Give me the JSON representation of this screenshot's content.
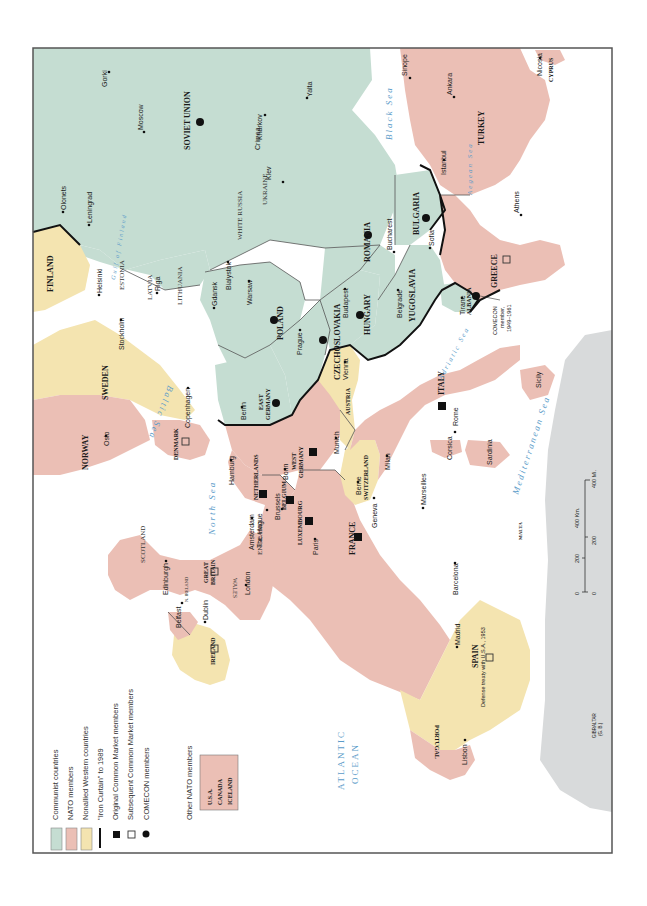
{
  "colors": {
    "communist": "#c5ddd2",
    "nato": "#ebbfb5",
    "nonallied": "#f4e4b0",
    "other_land": "#d8dadb",
    "sea_label": "#5a9bc9",
    "frame": "#555555"
  },
  "legend": {
    "items": [
      {
        "symbol": "swatch-communist",
        "label": "Communist countries"
      },
      {
        "symbol": "swatch-nato",
        "label": "NATO members"
      },
      {
        "symbol": "swatch-nonallied",
        "label": "Nonallied Western countries"
      },
      {
        "symbol": "iron-curtain-line",
        "label": "\"Iron Curtain\" to 1989"
      },
      {
        "symbol": "filled-square",
        "label": "Original Common Market members"
      },
      {
        "symbol": "open-square",
        "label": "Subsequent Common Market members"
      },
      {
        "symbol": "filled-circle",
        "label": "COMECON members"
      }
    ],
    "other_nato_title": "Other NATO members",
    "other_nato": [
      "U.S.A.",
      "CANADA",
      "ICELAND"
    ]
  },
  "countries": {
    "soviet_union": "SOVIET UNION",
    "finland": "FINLAND",
    "sweden": "SWEDEN",
    "norway": "NORWAY",
    "denmark": "DENMARK",
    "poland": "POLAND",
    "east_germany": "EAST GERMANY",
    "west_germany": "WEST GERMANY",
    "czechoslovakia": "CZECHOSLOVAKIA",
    "hungary": "HUNGARY",
    "romania": "ROMANIA",
    "bulgaria": "BULGARIA",
    "yugoslavia": "YUGOSLAVIA",
    "albania": "ALBANIA",
    "greece": "GREECE",
    "turkey": "TURKEY",
    "cyprus": "CYPRUS",
    "austria": "AUSTRIA",
    "switzerland": "SWITZERLAND",
    "italy": "ITALY",
    "france": "FRANCE",
    "netherlands": "NETHERLANDS",
    "belgium": "BELGIUM",
    "luxembourg": "LUXEMBOURG",
    "great_britain": "GREAT BRITAIN",
    "ireland": "IRELAND",
    "spain": "SPAIN",
    "portugal": "PORTUGAL",
    "malta": "MALTA",
    "gibraltar": "GIBRALTAR",
    "gibraltar_note": "(G. B.)"
  },
  "regions": {
    "ukraine": "UKRAINE",
    "white_russia": "WHITE RUSSIA",
    "lithuania": "LITHUANIA",
    "latvia": "LATVIA",
    "estonia": "ESTONIA",
    "scotland": "SCOTLAND",
    "england": "ENGLAND",
    "wales": "WALES",
    "n_ireland": "N. IRELAND",
    "crimea": "Crimea",
    "corsica": "Corsica",
    "sardinia": "Sardinia",
    "sicily": "Sicily"
  },
  "cities": {
    "gorki": "Gorki",
    "moscow": "Moscow",
    "olonets": "Olonets",
    "leningrad": "Leningrad",
    "kharkov": "Kharkov",
    "kiev": "Kiev",
    "yalta": "Yalta",
    "sinope": "Sinope",
    "ankara": "Ankara",
    "nicosia": "Nicosia",
    "istanbul": "Istanbul",
    "athens": "Athens",
    "sofia": "Sofia",
    "bucharest": "Bucharest",
    "belgrade": "Belgrade",
    "tirane": "Tirane",
    "budapest": "Budapest",
    "vienna": "Vienna",
    "prague": "Prague",
    "warsaw": "Warsaw",
    "bialystok": "Bialystok",
    "gdansk": "Gdansk",
    "riga": "Riga",
    "helsinki": "Helsinki",
    "stockholm": "Stockholm",
    "copenhagen": "Copenhagen",
    "oslo": "Oslo",
    "berlin": "Berlin",
    "hamburg": "Hamburg",
    "bonn": "Bonn",
    "munich": "Munich",
    "berne": "Berne",
    "geneva": "Geneva",
    "milan": "Milan",
    "rome": "Rome",
    "marseilles": "Marseilles",
    "paris": "Paris",
    "brussels": "Brussels",
    "amsterdam": "Amsterdam",
    "the_hague": "The Hague",
    "london": "London",
    "edinburgh": "Edinburgh",
    "belfast": "Belfast",
    "dublin": "Dublin",
    "barcelona": "Barcelona",
    "madrid": "Madrid",
    "lisbon": "Lisbon"
  },
  "seas": {
    "black_sea": "Black Sea",
    "aegean_sea": "Aegean Sea",
    "adriatic_sea": "Adriatic Sea",
    "mediterranean_sea": "Mediterranean Sea",
    "baltic_sea": "Baltic Sea",
    "north_sea": "North Sea",
    "gulf_of_finland": "Gulf of Finland",
    "atlantic_1": "ATLANTIC",
    "atlantic_2": "OCEAN"
  },
  "annotations": {
    "albania_note_1": "COMECON",
    "albania_note_2": "member,",
    "albania_note_3": "1949–1961",
    "spain_note": "Defense treaty with U.S.A., 1953"
  },
  "scale": {
    "km_ticks": [
      "0",
      "200",
      "400 Km."
    ],
    "mi_ticks": [
      "0",
      "200",
      "400 Mi."
    ]
  }
}
